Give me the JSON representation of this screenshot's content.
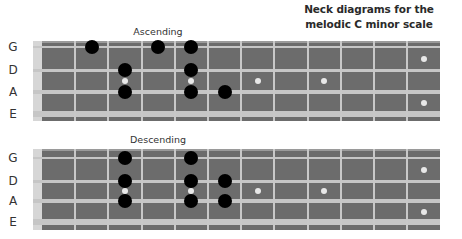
{
  "title": {
    "line1": "Neck diagrams for the",
    "line2": "melodic C minor scale"
  },
  "colors": {
    "board": "#6c6c6c",
    "string": "#c6c6c6",
    "nut": "#d6d6d6",
    "note": "#000000",
    "inlay": "#e8e8e8"
  },
  "strings": [
    "G",
    "D",
    "A",
    "E"
  ],
  "frets": 12,
  "inlay_frets": [
    3,
    5,
    7,
    9,
    12
  ],
  "diagrams": [
    {
      "label": "Ascending",
      "notes": [
        {
          "string": "G",
          "fret": 2
        },
        {
          "string": "G",
          "fret": 4
        },
        {
          "string": "G",
          "fret": 5
        },
        {
          "string": "D",
          "fret": 3
        },
        {
          "string": "D",
          "fret": 5
        },
        {
          "string": "A",
          "fret": 3
        },
        {
          "string": "A",
          "fret": 5
        },
        {
          "string": "A",
          "fret": 6
        }
      ]
    },
    {
      "label": "Descending",
      "notes": [
        {
          "string": "G",
          "fret": 3
        },
        {
          "string": "G",
          "fret": 5
        },
        {
          "string": "D",
          "fret": 3
        },
        {
          "string": "D",
          "fret": 5
        },
        {
          "string": "D",
          "fret": 6
        },
        {
          "string": "A",
          "fret": 3
        },
        {
          "string": "A",
          "fret": 5
        },
        {
          "string": "A",
          "fret": 6
        }
      ]
    }
  ]
}
